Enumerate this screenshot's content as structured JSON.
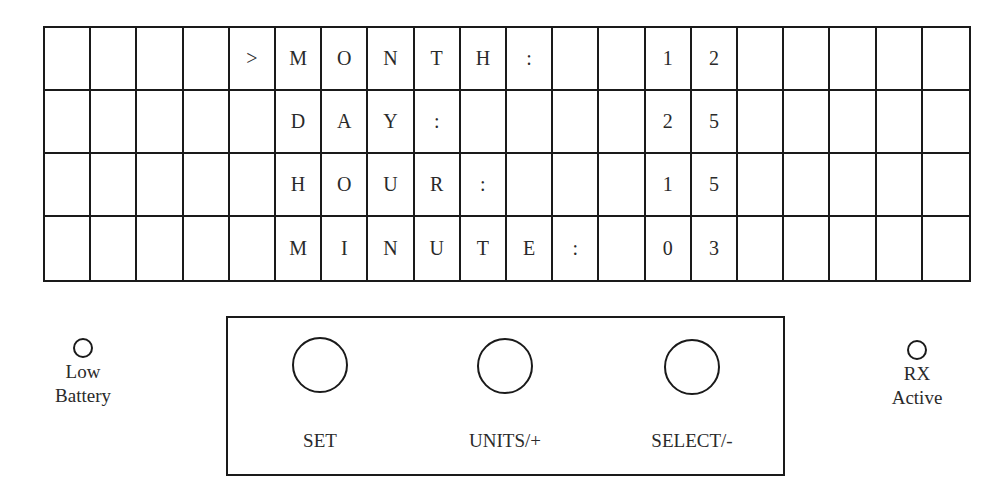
{
  "display": {
    "columns": 20,
    "rows": [
      {
        "cells": [
          "",
          "",
          "",
          "",
          ">",
          "M",
          "O",
          "N",
          "T",
          "H",
          ":",
          "",
          "",
          "1",
          "2",
          "",
          "",
          "",
          "",
          ""
        ]
      },
      {
        "cells": [
          "",
          "",
          "",
          "",
          "",
          "D",
          "A",
          "Y",
          ":",
          "",
          "",
          "",
          "",
          "2",
          "5",
          "",
          "",
          "",
          "",
          ""
        ]
      },
      {
        "cells": [
          "",
          "",
          "",
          "",
          "",
          "H",
          "O",
          "U",
          "R",
          ":",
          "",
          "",
          "",
          "1",
          "5",
          "",
          "",
          "",
          "",
          ""
        ]
      },
      {
        "cells": [
          "",
          "",
          "",
          "",
          "",
          "M",
          "I",
          "N",
          "U",
          "T",
          "E",
          ":",
          "",
          "0",
          "3",
          "",
          "",
          "",
          "",
          ""
        ]
      }
    ],
    "fields": [
      {
        "label": "MONTH",
        "value": "12",
        "selected": true
      },
      {
        "label": "DAY",
        "value": "25",
        "selected": false
      },
      {
        "label": "HOUR",
        "value": "15",
        "selected": false
      },
      {
        "label": "MINUTE",
        "value": "03",
        "selected": false
      }
    ],
    "cursor": ">"
  },
  "indicators": {
    "low_battery": {
      "label_line1": "Low",
      "label_line2": "Battery"
    },
    "rx_active": {
      "label_line1": "RX",
      "label_line2": "Active"
    }
  },
  "buttons": [
    {
      "label": "SET"
    },
    {
      "label": "UNITS/+"
    },
    {
      "label": "SELECT/-"
    }
  ],
  "colors": {
    "line": "#1a1a1a",
    "text": "#2a2a2a",
    "background": "#ffffff"
  }
}
